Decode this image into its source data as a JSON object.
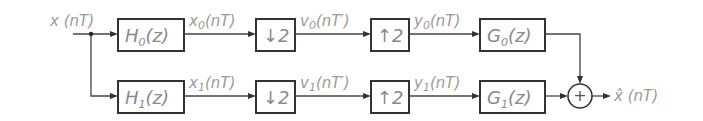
{
  "diagram": {
    "type": "two-channel filter bank",
    "input_label": "x (nT)",
    "output_label": "x̂ (nT)",
    "channels": [
      {
        "analysis_filter": {
          "name": "H",
          "sub": "0",
          "arg": "(z)"
        },
        "decimator": "↓2",
        "interpolator": "↑2",
        "synthesis_filter": {
          "name": "G",
          "sub": "0",
          "arg": "(z)"
        },
        "signals": {
          "x": {
            "name": "x",
            "sub": "0",
            "arg": "(nT)"
          },
          "v": {
            "name": "v",
            "sub": "0",
            "arg": "(nT′)"
          },
          "y": {
            "name": "y",
            "sub": "0",
            "arg": "(nT)"
          }
        }
      },
      {
        "analysis_filter": {
          "name": "H",
          "sub": "1",
          "arg": "(z)"
        },
        "decimator": "↓2",
        "interpolator": "↑2",
        "synthesis_filter": {
          "name": "G",
          "sub": "1",
          "arg": "(z)"
        },
        "signals": {
          "x": {
            "name": "x",
            "sub": "1",
            "arg": "(nT)"
          },
          "v": {
            "name": "v",
            "sub": "1",
            "arg": "(nT′)"
          },
          "y": {
            "name": "y",
            "sub": "1",
            "arg": "(nT)"
          }
        }
      }
    ],
    "summer_symbol": "+"
  }
}
